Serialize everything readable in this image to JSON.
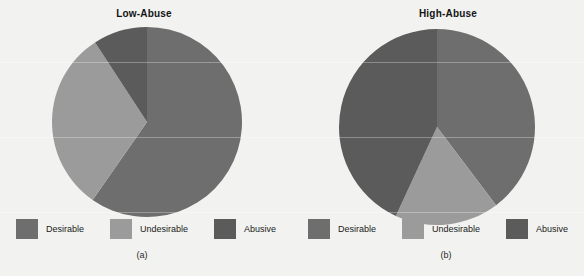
{
  "figure": {
    "background": "#f2f2f0",
    "panels": [
      {
        "id": "a",
        "title": "Low-Abuse",
        "caption": "(a)",
        "legend": [
          {
            "label": "Desirable",
            "color": "#6e6e6e"
          },
          {
            "label": "Undesirable",
            "color": "#9b9b9b"
          },
          {
            "label": "Abusive",
            "color": "#5b5b5b"
          }
        ]
      },
      {
        "id": "b",
        "title": "High-Abuse",
        "caption": "(b)",
        "legend": [
          {
            "label": "Desirable",
            "color": "#6e6e6e"
          },
          {
            "label": "Undesirable",
            "color": "#9b9b9b"
          },
          {
            "label": "Abusive",
            "color": "#5b5b5b"
          }
        ]
      }
    ]
  },
  "chart_data": [
    {
      "type": "pie",
      "title": "Low-Abuse",
      "caption": "(a)",
      "labels": [
        "Desirable",
        "Undesirable",
        "Abusive"
      ],
      "values": [
        59.7,
        31.1,
        9.2
      ],
      "colors": [
        "#6e6e6e",
        "#9b9b9b",
        "#5b5b5b"
      ],
      "start_angle_deg": 0,
      "direction": "clockwise",
      "legend_position": "bottom",
      "radius_px": 95,
      "center_px": [
        146,
        121
      ]
    },
    {
      "type": "pie",
      "title": "High-Abuse",
      "caption": "(b)",
      "labels": [
        "Desirable",
        "Undesirable",
        "Abusive"
      ],
      "values": [
        39.7,
        17.2,
        43.1
      ],
      "colors": [
        "#6e6e6e",
        "#9b9b9b",
        "#5b5b5b"
      ],
      "start_angle_deg": 0,
      "direction": "clockwise",
      "legend_position": "bottom",
      "radius_px": 98,
      "center_px": [
        436,
        126
      ]
    }
  ]
}
